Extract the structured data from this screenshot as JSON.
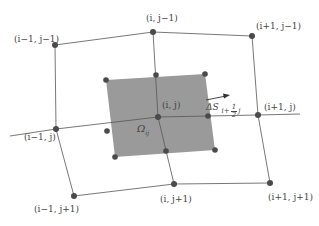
{
  "diagram": {
    "type": "finite-volume-mesh",
    "colors": {
      "background": "#ffffff",
      "grid_line": "#555555",
      "node": "#4a4a4a",
      "control_volume_fill": "#9a9a9a",
      "label": "#444444"
    },
    "nodes": [
      {
        "id": "im1_jm1",
        "label": "(i−1, j−1)",
        "x": 55,
        "y": 45
      },
      {
        "id": "i_jm1",
        "label": "(i, j−1)",
        "x": 153,
        "y": 32
      },
      {
        "id": "ip1_jm1",
        "label": "(i+1, j−1)",
        "x": 252,
        "y": 36
      },
      {
        "id": "im1_j",
        "label": "(i−1, j)",
        "x": 56,
        "y": 129
      },
      {
        "id": "i_j",
        "label": "(i, j)",
        "x": 158,
        "y": 117
      },
      {
        "id": "ip1_j",
        "label": "(i+1, j)",
        "x": 258,
        "y": 115
      },
      {
        "id": "im1_jp1",
        "label": "(i−1, j+1)",
        "x": 74,
        "y": 196
      },
      {
        "id": "i_jp1",
        "label": "(i, j+1)",
        "x": 174,
        "y": 184
      },
      {
        "id": "ip1_jp1",
        "label": "(i+1, j+1)",
        "x": 270,
        "y": 183
      }
    ],
    "control_volume": {
      "label": "Ω",
      "label_sub": "ij",
      "corners": [
        [
          106,
          80
        ],
        [
          205,
          74
        ],
        [
          215,
          150
        ],
        [
          115,
          157
        ]
      ],
      "points": [
        {
          "x": 106,
          "y": 80
        },
        {
          "x": 156,
          "y": 75
        },
        {
          "x": 205,
          "y": 74
        },
        {
          "x": 107,
          "y": 131
        },
        {
          "x": 203,
          "y": 116
        },
        {
          "x": 115,
          "y": 157
        },
        {
          "x": 166,
          "y": 151
        },
        {
          "x": 215,
          "y": 150
        }
      ]
    },
    "face_annotation": {
      "delta_label": "ΔS",
      "subscript_prefix": "i+",
      "fraction_num": "1",
      "fraction_den": "2",
      "subscript_suffix": "j",
      "arrow": {
        "x1": 206,
        "y1": 100,
        "x2": 228,
        "y2": 95
      }
    },
    "labels": {
      "im1_jm1": "(i−1, j−1)",
      "i_jm1": "(i, j−1)",
      "ip1_jm1": "(i+1, j−1)",
      "im1_j": "(i−1, j)",
      "i_j": "(i, j)",
      "ip1_j": "(i+1, j)",
      "im1_jp1": "(i−1, j+1)",
      "i_jp1": "(i, j+1)",
      "ip1_jp1": "(i+1, j+1)",
      "omega": "Ω",
      "omega_sub": "ij",
      "delta_s": "ΔS",
      "sub_prefix": "i+",
      "frac_num": "1",
      "frac_den": "2",
      "sub_suffix": "j"
    }
  }
}
